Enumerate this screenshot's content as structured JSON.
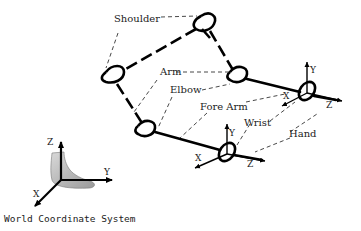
{
  "diagram": {
    "labels": {
      "shoulder": "Shoulder",
      "arm": "Arm",
      "elbow": "Elbow",
      "fore_arm": "Fore Arm",
      "wrist": "Wrist",
      "hand": "Hand"
    },
    "hand_frame_right": {
      "x": "X",
      "y": "Y",
      "z": "Z"
    },
    "hand_frame_lower": {
      "x": "X",
      "y": "Y",
      "z": "Z"
    },
    "world_frame": {
      "x": "X",
      "y": "Y",
      "z": "Z"
    },
    "caption": "World Coordinate System"
  }
}
